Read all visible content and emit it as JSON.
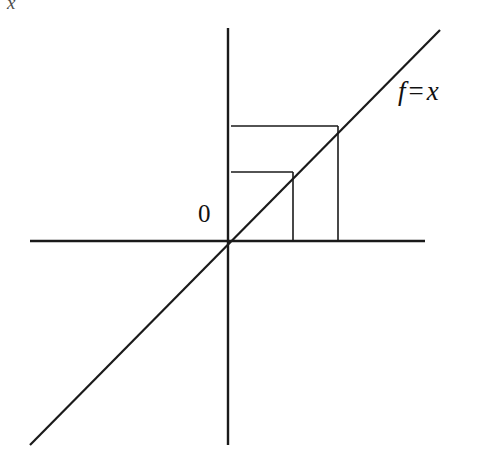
{
  "figure": {
    "kind": "cobweb-diagram",
    "background_color": "#ffffff",
    "stroke_color": "#1a1a1a",
    "width": 496,
    "height": 471
  },
  "labels": {
    "origin": "0",
    "function_name": "f",
    "function_operator": "=",
    "function_argument": "x",
    "corner_artifact": "x"
  },
  "chart_data": {
    "type": "line",
    "title": "",
    "subtitle": "",
    "xlabel": "",
    "ylabel": "",
    "grid": false,
    "legend_position": "top-right",
    "annotations": [
      {
        "text": "0",
        "x_px": 205,
        "y_px": 215,
        "role": "origin-marker"
      },
      {
        "text": "f = x",
        "x_px": 410,
        "y_px": 95,
        "role": "curve-label"
      }
    ],
    "axes": {
      "x_axis": {
        "y_px": 241,
        "x_start_px": 30,
        "x_end_px": 425,
        "arrowheads": false,
        "ticks": []
      },
      "y_axis": {
        "x_px": 228,
        "y_start_px": 28,
        "y_end_px": 445,
        "arrowheads": false,
        "ticks": []
      },
      "origin_px": {
        "x": 228,
        "y": 241
      }
    },
    "series": [
      {
        "name": "f = x",
        "kind": "identity-line",
        "slope": 1,
        "intercept": 0,
        "points_px": [
          {
            "x": 30,
            "y": 445
          },
          {
            "x": 440,
            "y": 30
          }
        ]
      },
      {
        "name": "cobweb-staircase",
        "kind": "polyline-segments",
        "segments": [
          {
            "id": "upper-horizontal",
            "x1": 231,
            "y1": 126,
            "x2": 338,
            "y2": 126
          },
          {
            "id": "outer-vertical",
            "x1": 338,
            "y1": 126,
            "x2": 338,
            "y2": 241
          },
          {
            "id": "lower-horizontal",
            "x1": 231,
            "y1": 172,
            "x2": 293,
            "y2": 172
          },
          {
            "id": "inner-vertical",
            "x1": 293,
            "y1": 172,
            "x2": 293,
            "y2": 241
          }
        ]
      }
    ]
  }
}
